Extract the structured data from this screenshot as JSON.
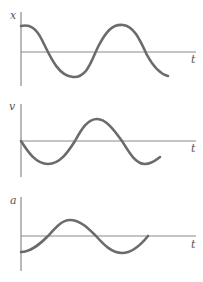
{
  "panels": [
    {
      "id": "position",
      "ylabel": "x",
      "xlabel": "t"
    },
    {
      "id": "velocity",
      "ylabel": "v",
      "xlabel": "t"
    },
    {
      "id": "acceleration",
      "ylabel": "a",
      "xlabel": "t"
    }
  ],
  "colors": {
    "curve": "#6b6b6b",
    "axis": "#8a8a8a",
    "label": "#555555"
  }
}
